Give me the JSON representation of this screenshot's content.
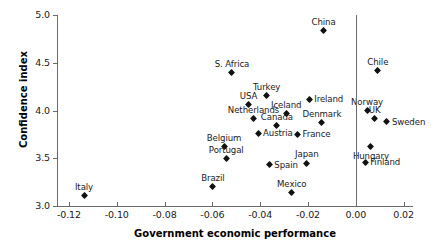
{
  "chart_data": {
    "type": "scatter",
    "title": "",
    "xlabel": "Government economic performance",
    "ylabel": "Confidence index",
    "xlim": [
      -0.125,
      0.0235
    ],
    "ylim": [
      3.0,
      5.0
    ],
    "grid": false,
    "legend": "none",
    "xticks": [
      "-0.12",
      "-0.10",
      "-0.08",
      "-0.06",
      "-0.04",
      "-0.02",
      "0.00",
      "0.02"
    ],
    "xtick_values": [
      -0.12,
      -0.1,
      -0.08,
      -0.06,
      -0.04,
      -0.02,
      0.0,
      0.02
    ],
    "yticks": [
      "3.0",
      "3.5",
      "4.0",
      "4.5",
      "5.0"
    ],
    "ytick_values": [
      3.0,
      3.5,
      4.0,
      4.5,
      5.0
    ],
    "reference_line_x": 0.0,
    "points": [
      {
        "label": "China",
        "x": -0.0135,
        "y": 4.84,
        "label_pos": "above"
      },
      {
        "label": "Chile",
        "x": 0.0092,
        "y": 4.42,
        "label_pos": "above"
      },
      {
        "label": "S. Africa",
        "x": -0.0518,
        "y": 4.4,
        "label_pos": "above"
      },
      {
        "label": "Turkey",
        "x": -0.0373,
        "y": 4.16,
        "label_pos": "above"
      },
      {
        "label": "Ireland",
        "x": -0.0195,
        "y": 4.12,
        "label_pos": "right"
      },
      {
        "label": "USA",
        "x": -0.0449,
        "y": 4.06,
        "label_pos": "above"
      },
      {
        "label": "Norway",
        "x": 0.0047,
        "y": 4.0,
        "label_pos": "above"
      },
      {
        "label": "Iceland",
        "x": -0.0291,
        "y": 3.97,
        "label_pos": "above"
      },
      {
        "label": "UK",
        "x": 0.0079,
        "y": 3.92,
        "label_pos": "above"
      },
      {
        "label": "Netherlands",
        "x": -0.0428,
        "y": 3.92,
        "label_pos": "above"
      },
      {
        "label": "Sweden",
        "x": 0.013,
        "y": 3.88,
        "label_pos": "right"
      },
      {
        "label": "Denmark",
        "x": -0.0142,
        "y": 3.87,
        "label_pos": "above"
      },
      {
        "label": "Canada",
        "x": -0.033,
        "y": 3.84,
        "label_pos": "above"
      },
      {
        "label": "Austria",
        "x": -0.0409,
        "y": 3.76,
        "label_pos": "right"
      },
      {
        "label": "France",
        "x": -0.0244,
        "y": 3.75,
        "label_pos": "right"
      },
      {
        "label": "Belgium",
        "x": -0.0551,
        "y": 3.62,
        "label_pos": "above"
      },
      {
        "label": "Hungary",
        "x": 0.0063,
        "y": 3.62,
        "label_pos": "below"
      },
      {
        "label": "Portugal",
        "x": -0.0542,
        "y": 3.5,
        "label_pos": "above"
      },
      {
        "label": "Finland",
        "x": 0.0039,
        "y": 3.46,
        "label_pos": "right"
      },
      {
        "label": "Japan",
        "x": -0.0205,
        "y": 3.45,
        "label_pos": "above"
      },
      {
        "label": "Spain",
        "x": -0.0362,
        "y": 3.43,
        "label_pos": "right"
      },
      {
        "label": "Brazil",
        "x": -0.0598,
        "y": 3.2,
        "label_pos": "above"
      },
      {
        "label": "Mexico",
        "x": -0.0268,
        "y": 3.14,
        "label_pos": "above"
      },
      {
        "label": "Italy",
        "x": -0.1137,
        "y": 3.11,
        "label_pos": "above"
      }
    ]
  }
}
